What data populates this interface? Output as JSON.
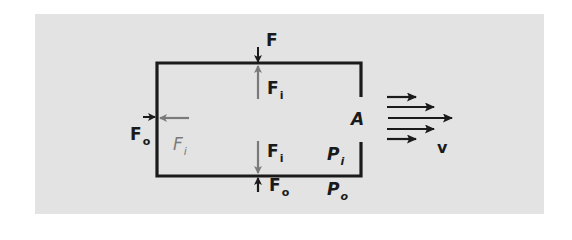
{
  "figure": {
    "colors": {
      "background": "#ffffff",
      "panel": "#e3e3e3",
      "outline": "#1a1a1a",
      "inner_force": "#7a7a7a",
      "outer_force": "#1a1a1a"
    }
  },
  "labels": {
    "top_external_force": {
      "main": "F",
      "sub": ""
    },
    "top_internal_force": {
      "main": "F",
      "sub": "i"
    },
    "bottom_internal_force": {
      "main": "F",
      "sub": "i"
    },
    "bottom_external_force": {
      "main": "F",
      "sub": "o"
    },
    "left_external_force": {
      "main": "F",
      "sub": "o"
    },
    "left_internal_force": {
      "main": "F",
      "sub": "i"
    },
    "opening_area": {
      "main": "A"
    },
    "inside_pressure": {
      "main": "P",
      "sub": "i"
    },
    "outside_pressure": {
      "main": "P",
      "sub": "o"
    },
    "velocity": {
      "main": "v"
    }
  }
}
